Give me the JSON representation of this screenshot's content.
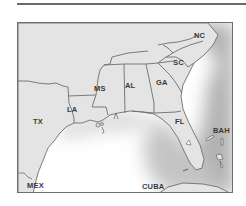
{
  "map": {
    "title": "",
    "colors": {
      "land": "#e4e4e4",
      "water": "#ffffff",
      "coastal_shade": "#b8b8b8",
      "border": "#6e6e6e"
    },
    "labels": {
      "nc": "NC",
      "sc": "SC",
      "ga": "GA",
      "al": "AL",
      "ms": "MS",
      "la": "LA",
      "tx": "TX",
      "fl": "FL",
      "bah": "BAH",
      "mex": "MEX",
      "cuba": "CUBA"
    }
  }
}
